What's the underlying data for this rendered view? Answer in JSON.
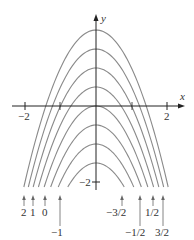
{
  "figure": {
    "axes": {
      "x_label": "x",
      "y_label": "y",
      "x_ticks": [
        {
          "value": -2,
          "label": "−2"
        },
        {
          "value": 2,
          "label": "2"
        }
      ],
      "y_ticks": [
        {
          "value": -2,
          "label": "−2"
        }
      ]
    },
    "curves": [
      {
        "c": 2,
        "label": "2"
      },
      {
        "c": 1.5,
        "label": "3/2"
      },
      {
        "c": 1,
        "label": "1"
      },
      {
        "c": 0.5,
        "label": "1/2"
      },
      {
        "c": 0,
        "label": "0"
      },
      {
        "c": -0.5,
        "label": "−1/2"
      },
      {
        "c": -1,
        "label": "−1"
      },
      {
        "c": -1.5,
        "label": "−3/2"
      }
    ],
    "bottom_labels": [
      {
        "text": "2",
        "side": "left",
        "row": 1
      },
      {
        "text": "1",
        "side": "left",
        "row": 1
      },
      {
        "text": "0",
        "side": "left",
        "row": 1
      },
      {
        "text": "−1",
        "side": "left",
        "row": 2
      },
      {
        "text": "−3/2",
        "side": "right",
        "row": 1
      },
      {
        "text": "−1/2",
        "side": "right",
        "row": 2
      },
      {
        "text": "1/2",
        "side": "right",
        "row": 1
      },
      {
        "text": "3/2",
        "side": "right",
        "row": 2
      }
    ],
    "colors": {
      "curve": "#8a8a8a",
      "axis": "#222222",
      "text": "#333333"
    }
  }
}
